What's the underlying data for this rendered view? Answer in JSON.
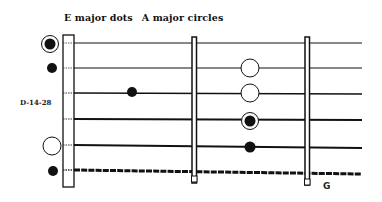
{
  "title": {
    "part1": "E major dots",
    "part2": "A major circles"
  },
  "side_label": "D-14-28",
  "fret_label": "G",
  "colors": {
    "ink": "#111111",
    "background": "#ffffff"
  },
  "fretboard": {
    "strings": 6,
    "frets_shown": 2,
    "nut": "double-line rectangle at left",
    "string_order": "string 1 (high, thinnest) at top to string 6 (low, wound) at bottom"
  },
  "markers": [
    {
      "position": "open",
      "string": 1,
      "style": "dot-in-circle",
      "meaning": "E major and A major"
    },
    {
      "position": "open",
      "string": 2,
      "style": "dot",
      "meaning": "E major"
    },
    {
      "position": "open",
      "string": 5,
      "style": "circle",
      "meaning": "A major"
    },
    {
      "position": "open",
      "string": 6,
      "style": "dot",
      "meaning": "E major"
    },
    {
      "position": "fret 1",
      "string": 3,
      "style": "dot",
      "meaning": "E major"
    },
    {
      "position": "fret 2",
      "string": 2,
      "style": "circle",
      "meaning": "A major"
    },
    {
      "position": "fret 2",
      "string": 3,
      "style": "circle",
      "meaning": "A major"
    },
    {
      "position": "fret 2",
      "string": 4,
      "style": "dot-in-circle",
      "meaning": "E major and A major"
    },
    {
      "position": "fret 2",
      "string": 5,
      "style": "dot",
      "meaning": "E major"
    }
  ]
}
